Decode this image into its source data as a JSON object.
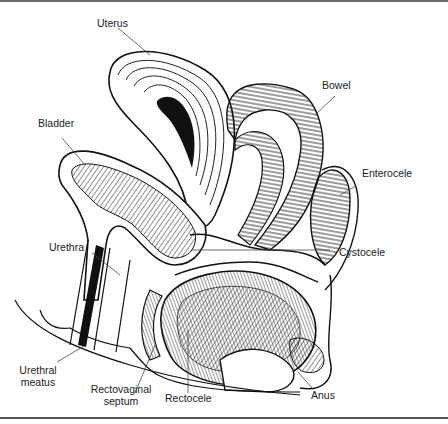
{
  "figure": {
    "type": "anatomical sagittal section",
    "labels": {
      "uterus": "Uterus",
      "bowel": "Bowel",
      "bladder": "Bladder",
      "enterocele": "Enterocele",
      "urethra": "Urethra",
      "cystocele": "Cystocele",
      "urethral_meatus_1": "Urethral",
      "urethral_meatus_2": "meatus",
      "rectovaginal_septum_1": "Rectovaginal",
      "rectovaginal_septum_2": "septum",
      "rectocele": "Rectocele",
      "anus": "Anus"
    },
    "colors": {
      "ink": "#1a1a1a",
      "leader": "#444444",
      "background": "#ffffff"
    }
  }
}
